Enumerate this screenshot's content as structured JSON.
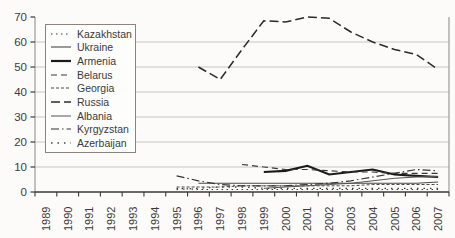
{
  "chart_data": {
    "type": "line",
    "title": "",
    "xlabel": "",
    "ylabel": "",
    "categories": [
      "1989",
      "1990",
      "1991",
      "1992",
      "1993",
      "1994",
      "1995",
      "1996",
      "1997",
      "1998",
      "1999",
      "2000",
      "2001",
      "2002",
      "2003",
      "2004",
      "2005",
      "2006",
      "2007"
    ],
    "y_axis": {
      "min": 0,
      "max": 70,
      "step": 10,
      "ticks": [
        0,
        10,
        20,
        30,
        40,
        50,
        60,
        70
      ]
    },
    "grid": true,
    "legend_position": "top-left-inside",
    "style": {
      "grid_color": "#c6c6c4",
      "axis_color": "#3a3a3a",
      "side_border_color": "#9a9a98",
      "top_border_tints": [
        "#44b45c",
        "#a08cc0",
        "#909090",
        "#a38cc4",
        "#909090",
        "#3fbf5f"
      ]
    },
    "series": [
      {
        "name": "Kazakhstan",
        "color": "#3c3c3c",
        "dash": "1.5 3.5",
        "width": 1.2,
        "values": [
          null,
          null,
          null,
          null,
          null,
          null,
          1.5,
          1,
          1,
          1,
          1,
          1,
          1,
          1,
          1,
          1,
          1,
          1,
          1
        ]
      },
      {
        "name": "Ukraine",
        "color": "#4a4a4a",
        "dash": "",
        "width": 1.1,
        "values": [
          null,
          null,
          null,
          null,
          null,
          null,
          null,
          3.5,
          3.5,
          3.5,
          3.5,
          3.5,
          3.5,
          3.5,
          3.5,
          3.5,
          3.5,
          3.5,
          4
        ]
      },
      {
        "name": "Armenia",
        "color": "#1a1a1a",
        "dash": "",
        "width": 2.2,
        "values": [
          null,
          null,
          null,
          null,
          null,
          null,
          null,
          null,
          null,
          null,
          8,
          8.5,
          10.5,
          7,
          8,
          9,
          7,
          6.5,
          6
        ]
      },
      {
        "name": "Belarus",
        "color": "#383838",
        "dash": "6 4",
        "width": 1.2,
        "values": [
          null,
          null,
          null,
          null,
          null,
          null,
          null,
          null,
          null,
          11,
          10,
          9,
          9,
          8.5,
          8,
          8,
          7.5,
          7.5,
          7.5
        ]
      },
      {
        "name": "Georgia",
        "color": "#4a4a4a",
        "dash": "3 2",
        "width": 1,
        "values": [
          null,
          null,
          null,
          null,
          null,
          null,
          2,
          2,
          2,
          2.5,
          2.5,
          2.5,
          2.5,
          2.5,
          2.5,
          3,
          3,
          3,
          3
        ]
      },
      {
        "name": "Russia",
        "color": "#2b2b2b",
        "dash": "9 4",
        "width": 1.5,
        "values": [
          null,
          null,
          null,
          null,
          null,
          null,
          null,
          50,
          45,
          57,
          68.5,
          68,
          70,
          69.5,
          64,
          60,
          57,
          55,
          49
        ]
      },
      {
        "name": "Albania",
        "color": "#555555",
        "dash": "",
        "width": 1,
        "values": [
          null,
          null,
          null,
          null,
          null,
          null,
          null,
          null,
          null,
          null,
          1.5,
          2,
          2.5,
          3,
          3.5,
          4.5,
          5.5,
          6,
          6.3
        ]
      },
      {
        "name": "Kyrgyzstan",
        "color": "#333333",
        "dash": "8 3 1.5 3",
        "width": 1.2,
        "values": [
          null,
          null,
          null,
          null,
          null,
          null,
          6.5,
          4.5,
          3,
          2.5,
          2.5,
          2.5,
          3,
          3.5,
          4.5,
          6,
          7.5,
          9,
          8.5
        ]
      },
      {
        "name": "Azerbaijan",
        "color": "#444444",
        "dash": "1.5 5",
        "width": 1.3,
        "values": [
          null,
          null,
          null,
          null,
          null,
          null,
          1,
          1.5,
          2,
          2,
          1.5,
          1.5,
          1.5,
          1.5,
          1.5,
          1.5,
          1.5,
          1.5,
          1.5
        ]
      }
    ]
  }
}
